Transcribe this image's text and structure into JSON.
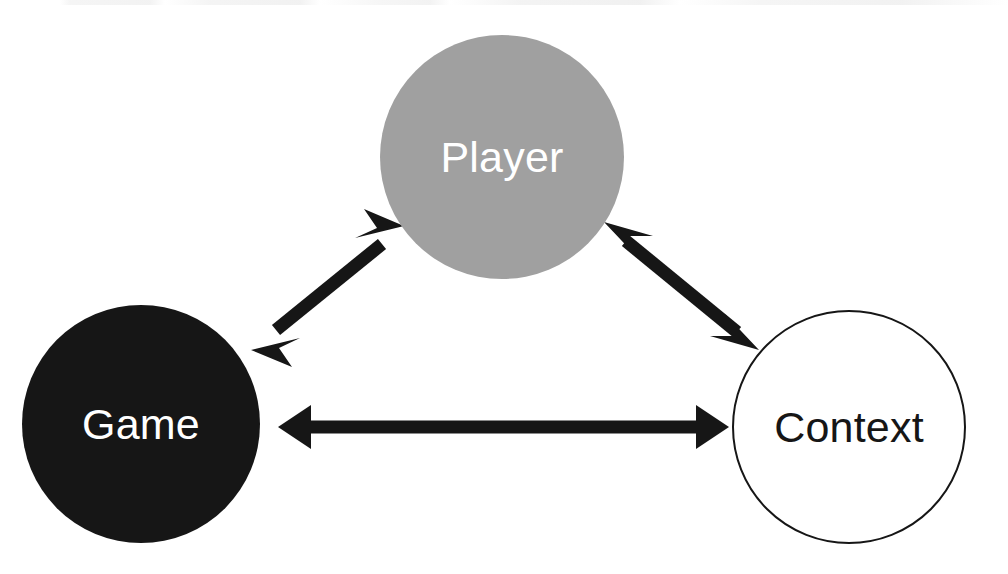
{
  "diagram": {
    "background_color": "#ffffff",
    "width": 1008,
    "height": 574,
    "nodes": [
      {
        "id": "player",
        "label": "Player",
        "shape": "circle",
        "fill_color": "#a0a0a0",
        "text_color": "#ffffff",
        "border_color": "none",
        "center_x": 502,
        "center_y": 157,
        "radius": 122
      },
      {
        "id": "game",
        "label": "Game",
        "shape": "circle",
        "fill_color": "#161616",
        "text_color": "#ffffff",
        "border_color": "none",
        "center_x": 141,
        "center_y": 424,
        "radius": 119
      },
      {
        "id": "context",
        "label": "Context",
        "shape": "circle",
        "fill_color": "#ffffff",
        "text_color": "#161616",
        "border_color": "#161616",
        "center_x": 849,
        "center_y": 427,
        "radius": 117
      }
    ],
    "edges": [
      {
        "id": "game-player",
        "from": "game",
        "to": "player",
        "direction": "bidirectional",
        "color": "#161616",
        "x1": 258,
        "y1": 345,
        "x2": 398,
        "y2": 231,
        "thickness": 13
      },
      {
        "id": "player-context",
        "from": "player",
        "to": "context",
        "direction": "bidirectional",
        "color": "#161616",
        "x1": 609,
        "y1": 227,
        "x2": 753,
        "y2": 345,
        "thickness": 13
      },
      {
        "id": "game-context",
        "from": "game",
        "to": "context",
        "direction": "bidirectional",
        "color": "#161616",
        "x1": 281,
        "y1": 427,
        "x2": 726,
        "y2": 427,
        "thickness": 13
      }
    ]
  }
}
